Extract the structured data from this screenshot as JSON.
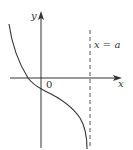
{
  "diagram": {
    "type": "function-graph",
    "labels": {
      "y_axis": "y",
      "x_axis": "x",
      "origin": "0",
      "asymptote": "x = a"
    },
    "colors": {
      "axis": "#333333",
      "curve": "#333333",
      "asymptote": "#555555",
      "background": "#ffffff"
    },
    "features": {
      "curve": "decreasing curve crossing negative x-axis, passing below origin on y-axis, approaching vertical asymptote x = a downward",
      "asymptote": "vertical dashed line at x = a"
    }
  }
}
